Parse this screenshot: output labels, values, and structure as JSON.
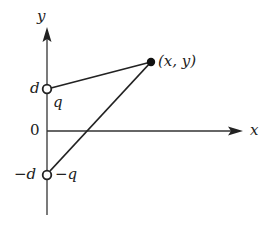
{
  "diagram": {
    "type": "charge-geometry",
    "axes": {
      "x_label": "x",
      "y_label": "y",
      "origin_label": "0"
    },
    "charges": [
      {
        "position_label": "d",
        "charge_label": "q",
        "marker": "open-circle"
      },
      {
        "position_label": "−d",
        "charge_label": "−q",
        "marker": "open-circle"
      }
    ],
    "field_point": {
      "label": "(x, y)",
      "marker": "filled-circle"
    },
    "colors": {
      "stroke": "#222222",
      "background": "#ffffff"
    }
  }
}
